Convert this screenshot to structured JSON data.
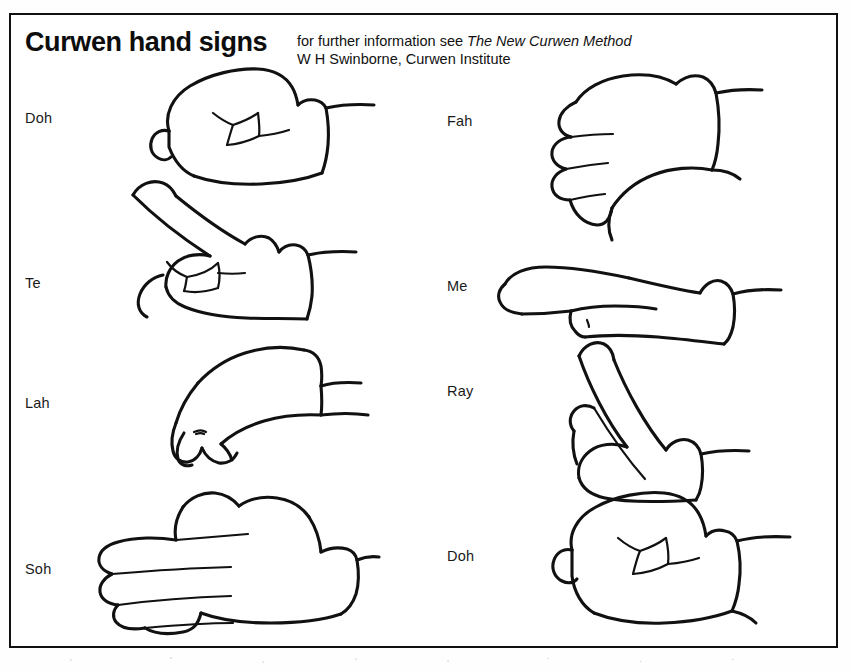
{
  "page": {
    "title": "Curwen hand signs",
    "subtitle_line1_prefix": "for further information see ",
    "subtitle_line1_booktitle": "The New Curwen Method",
    "subtitle_line2": "W H Swinborne, Curwen Institute",
    "ink_color": "#111111",
    "background_color": "#ffffff"
  },
  "signs": {
    "left_column": [
      {
        "label": "Doh",
        "art": "fist-closed",
        "description": "closed fist, knuckles forward"
      },
      {
        "label": "Te",
        "art": "index-pointing-up-diagonal",
        "description": "index finger pointing up diagonally"
      },
      {
        "label": "Lah",
        "art": "hand-limp-hanging-down",
        "description": "relaxed hand drooping downward"
      },
      {
        "label": "Soh",
        "art": "flat-hand-palm-down",
        "description": "flat open hand, fingers extended forward"
      }
    ],
    "right_column": [
      {
        "label": "Fah",
        "art": "thumb-pointing-down",
        "description": "fist with thumb pointing downward"
      },
      {
        "label": "Me",
        "art": "flat-hand-edge-on",
        "description": "flat hand held level, edge on"
      },
      {
        "label": "Ray",
        "art": "hand-angled-up-diagonal",
        "description": "flat hand angled upward diagonally"
      },
      {
        "label": "Doh",
        "art": "fist-closed",
        "description": "closed fist, knuckles forward"
      }
    ]
  }
}
